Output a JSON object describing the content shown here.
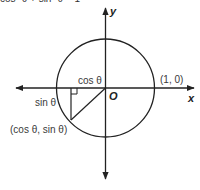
{
  "header": {
    "clipped_text": "cos² θ + sin² θ = 1"
  },
  "diagram": {
    "type": "unit-circle",
    "axes": {
      "x_label": "x",
      "y_label": "y",
      "origin_label": "O"
    },
    "labels": {
      "point_on_x_axis": "(1, 0)",
      "cos_segment": "cos θ",
      "sin_segment": "sin θ",
      "point_on_circle": "(cos θ, sin θ)"
    },
    "colors": {
      "stroke": "#222222",
      "text": "#3a3a3a"
    }
  }
}
